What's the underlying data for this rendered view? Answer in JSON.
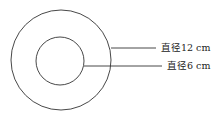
{
  "diagram": {
    "outer_circle": {
      "cx": 61,
      "cy": 60,
      "r": 50,
      "label": "直径12 cm"
    },
    "inner_circle": {
      "cx": 60,
      "cy": 61,
      "r": 24,
      "label": "直径6 cm"
    },
    "stroke_color": "#333333"
  }
}
